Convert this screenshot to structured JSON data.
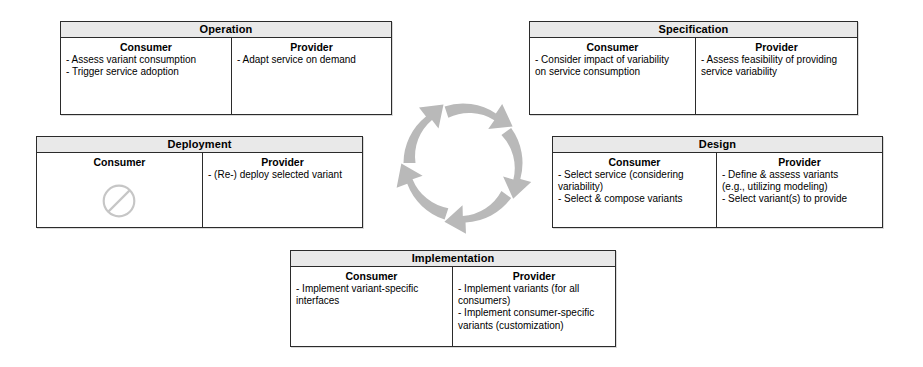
{
  "diagram": {
    "cycle": {
      "name": "lifecycle-cycle",
      "direction": "clockwise",
      "arrow_count": 5,
      "color": "#b3b3b3"
    },
    "column_headers": {
      "consumer": "Consumer",
      "provider": "Provider"
    },
    "not_applicable_symbol": "no-entry",
    "phases": [
      {
        "id": "operation",
        "title": "Operation",
        "consumer": {
          "header": "Consumer",
          "items": [
            "- Assess variant consumption",
            "- Trigger service adoption"
          ]
        },
        "provider": {
          "header": "Provider",
          "items": [
            "- Adapt service on demand"
          ]
        }
      },
      {
        "id": "specification",
        "title": "Specification",
        "consumer": {
          "header": "Consumer",
          "items": [
            "- Consider impact of variability\non service consumption"
          ]
        },
        "provider": {
          "header": "Provider",
          "items": [
            "- Assess feasibility of providing\nservice variability"
          ]
        }
      },
      {
        "id": "deployment",
        "title": "Deployment",
        "consumer": {
          "header": "Consumer",
          "items": [],
          "not_applicable": true
        },
        "provider": {
          "header": "Provider",
          "items": [
            "- (Re-) deploy selected variant"
          ]
        }
      },
      {
        "id": "design",
        "title": "Design",
        "consumer": {
          "header": "Consumer",
          "items": [
            "- Select service (considering\nvariability)",
            "- Select & compose variants"
          ]
        },
        "provider": {
          "header": "Provider",
          "items": [
            "- Define & assess variants\n(e.g., utilizing modeling)",
            "- Select variant(s) to provide"
          ]
        }
      },
      {
        "id": "implementation",
        "title": "Implementation",
        "consumer": {
          "header": "Consumer",
          "items": [
            "- Implement variant-specific\ninterfaces"
          ]
        },
        "provider": {
          "header": "Provider",
          "items": [
            "- Implement variants (for all\nconsumers)",
            "- Implement consumer-specific\nvariants (customization)"
          ]
        }
      }
    ]
  }
}
